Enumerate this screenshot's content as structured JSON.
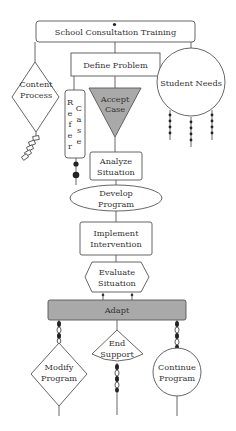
{
  "diagram": {
    "title_node": "School Consultation Training",
    "nodes": {
      "define_problem": "Define Problem",
      "content_process": [
        "Content",
        "Process"
      ],
      "student_needs": "Student Needs",
      "refer": [
        "R",
        "e",
        "f",
        "e",
        "r"
      ],
      "case": [
        "C",
        "a",
        "s",
        "e"
      ],
      "accept_case": [
        "Accept",
        "Case"
      ],
      "analyze_situation": [
        "Analyze",
        "Situation"
      ],
      "develop_program": [
        "Develop",
        "Program"
      ],
      "implement_intervention": [
        "Implement",
        "Intervention"
      ],
      "evaluate_situation": [
        "Evaluate",
        "Situation"
      ],
      "adapt": "Adapt",
      "modify_program": [
        "Modify",
        "Program"
      ],
      "end_support": [
        "End",
        "Support"
      ],
      "continue_program": [
        "Continue",
        "Program"
      ]
    },
    "colors": {
      "line": "#555555",
      "shaded_fill": "#a9a9a9",
      "background": "#ffffff"
    }
  }
}
